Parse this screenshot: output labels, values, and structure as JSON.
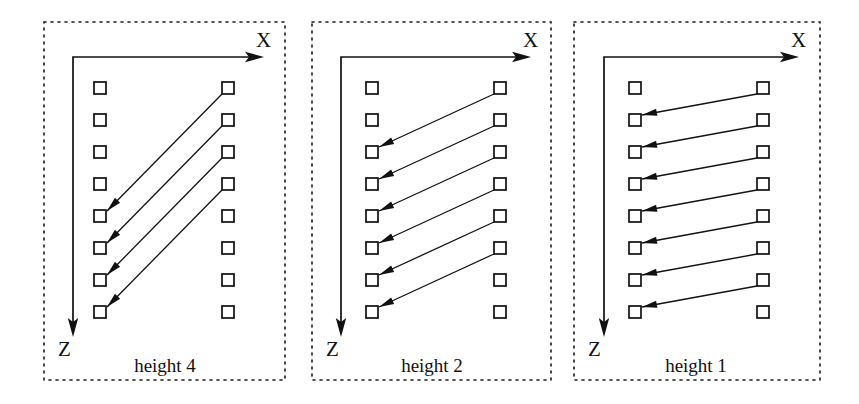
{
  "figure": {
    "canvas": {
      "width": 859,
      "height": 404,
      "background": "#ffffff"
    },
    "ink_color": "#111111",
    "square_size": 12,
    "row_spacing": 32,
    "row_count": 8,
    "first_row_y": 88,
    "panels": [
      {
        "id": "height-4",
        "caption": "height 4",
        "caption_x": 165,
        "caption_y": 372,
        "frame": {
          "x": 44,
          "y": 22,
          "width": 241,
          "height": 358
        },
        "axes": {
          "x_label": "X",
          "z_label": "Z",
          "x_label_x": 256,
          "x_label_y": 47,
          "z_label_x": 58,
          "z_label_y": 356,
          "origin_x": 73,
          "origin_y": 57,
          "x_end": 253,
          "z_end": 326
        },
        "columns": {
          "left_x": 100,
          "right_x": 228
        },
        "offset": 4,
        "arrows": [
          {
            "from_row": 1,
            "to_row": 5
          },
          {
            "from_row": 2,
            "to_row": 6
          },
          {
            "from_row": 3,
            "to_row": 7
          },
          {
            "from_row": 4,
            "to_row": 8
          }
        ]
      },
      {
        "id": "height-2",
        "caption": "height 2",
        "caption_x": 432,
        "caption_y": 372,
        "frame": {
          "x": 312,
          "y": 22,
          "width": 239,
          "height": 358
        },
        "axes": {
          "x_label": "X",
          "z_label": "Z",
          "x_label_x": 523,
          "x_label_y": 47,
          "z_label_x": 326,
          "z_label_y": 356,
          "origin_x": 341,
          "origin_y": 57,
          "x_end": 520,
          "z_end": 326
        },
        "columns": {
          "left_x": 372,
          "right_x": 500
        },
        "offset": 2,
        "arrows": [
          {
            "from_row": 1,
            "to_row": 3
          },
          {
            "from_row": 2,
            "to_row": 4
          },
          {
            "from_row": 3,
            "to_row": 5
          },
          {
            "from_row": 4,
            "to_row": 6
          },
          {
            "from_row": 5,
            "to_row": 7
          },
          {
            "from_row": 6,
            "to_row": 8
          }
        ]
      },
      {
        "id": "height-1",
        "caption": "height 1",
        "caption_x": 696,
        "caption_y": 372,
        "frame": {
          "x": 574,
          "y": 22,
          "width": 246,
          "height": 358
        },
        "axes": {
          "x_label": "X",
          "z_label": "Z",
          "x_label_x": 791,
          "x_label_y": 47,
          "z_label_x": 588,
          "z_label_y": 356,
          "origin_x": 604,
          "origin_y": 57,
          "x_end": 788,
          "z_end": 326
        },
        "columns": {
          "left_x": 635,
          "right_x": 763
        },
        "offset": 1,
        "arrows": [
          {
            "from_row": 1,
            "to_row": 2
          },
          {
            "from_row": 2,
            "to_row": 3
          },
          {
            "from_row": 3,
            "to_row": 4
          },
          {
            "from_row": 4,
            "to_row": 5
          },
          {
            "from_row": 5,
            "to_row": 6
          },
          {
            "from_row": 6,
            "to_row": 7
          },
          {
            "from_row": 7,
            "to_row": 8
          }
        ]
      }
    ]
  }
}
